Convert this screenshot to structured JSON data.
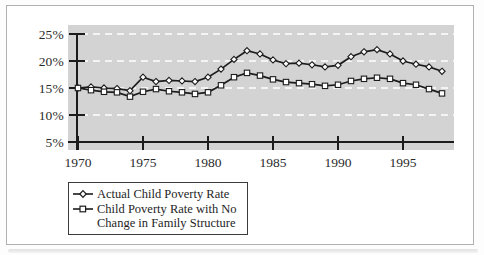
{
  "figure": {
    "border_color": "#b0b0b0",
    "background": "#ffffff"
  },
  "chart_data": {
    "type": "line",
    "title": "",
    "xlabel": "",
    "ylabel": "",
    "x": [
      1970,
      1971,
      1972,
      1973,
      1974,
      1975,
      1976,
      1977,
      1978,
      1979,
      1980,
      1981,
      1982,
      1983,
      1984,
      1985,
      1986,
      1987,
      1988,
      1989,
      1990,
      1991,
      1992,
      1993,
      1994,
      1995,
      1996,
      1997,
      1998
    ],
    "series": [
      {
        "name": "Actual Child Poverty Rate",
        "marker": "diamond",
        "values": [
          15.0,
          15.2,
          15.0,
          14.9,
          14.5,
          17.0,
          16.2,
          16.4,
          16.3,
          16.2,
          17.0,
          18.5,
          20.3,
          21.9,
          21.3,
          20.2,
          19.5,
          19.6,
          19.3,
          18.9,
          19.2,
          20.8,
          21.7,
          22.1,
          21.3,
          20.0,
          19.4,
          18.9,
          18.1
        ]
      },
      {
        "name": "Child Poverty Rate with No Change in Family Structure",
        "marker": "square",
        "values": [
          15.0,
          14.6,
          14.3,
          14.2,
          13.4,
          14.3,
          14.8,
          14.4,
          14.2,
          13.9,
          14.2,
          15.5,
          17.0,
          17.8,
          17.3,
          16.6,
          16.1,
          15.9,
          15.7,
          15.4,
          15.6,
          16.3,
          16.7,
          16.9,
          16.7,
          15.9,
          15.6,
          14.8,
          14.0
        ]
      }
    ],
    "ylim": [
      5,
      25
    ],
    "xlim": [
      1969.5,
      1999
    ],
    "y_ticks": [
      {
        "value": 25,
        "label": "25%"
      },
      {
        "value": 20,
        "label": "20%"
      },
      {
        "value": 15,
        "label": "15%"
      },
      {
        "value": 10,
        "label": "10%"
      },
      {
        "value": 5,
        "label": "5%"
      }
    ],
    "x_ticks": [
      {
        "value": 1970,
        "label": "1970"
      },
      {
        "value": 1975,
        "label": "1975"
      },
      {
        "value": 1980,
        "label": "1980"
      },
      {
        "value": 1985,
        "label": "1985"
      },
      {
        "value": 1990,
        "label": "1990"
      },
      {
        "value": 1995,
        "label": "1995"
      }
    ],
    "grid": "horizontal-white-dashed",
    "legend_position": "bottom-left",
    "plot_background": "#d3d3d3",
    "gridline_color": "#ffffff",
    "line_color": "#1c1c1c",
    "marker_fill": "#ffffff",
    "axis_color": "#1c1c1c"
  },
  "legend": {
    "entries": [
      {
        "marker": "diamond-marker-icon",
        "label": "Actual Child Poverty Rate"
      },
      {
        "marker": "square-marker-icon",
        "label_lines": [
          "Child Poverty Rate with No",
          "Change in Family Structure"
        ]
      }
    ]
  }
}
